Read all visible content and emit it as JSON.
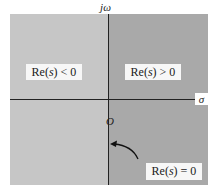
{
  "diagram": {
    "axes": {
      "vertical_label": "jω",
      "horizontal_label": "σ",
      "origin_label": "O"
    },
    "regions": {
      "left_half": {
        "label_pre": "Re(",
        "label_var": "s",
        "label_post": ") < 0",
        "color": "#c6c6c6"
      },
      "right_half": {
        "label_pre": "Re(",
        "label_var": "s",
        "label_post": ") > 0",
        "color": "#a9a9a9"
      }
    },
    "annotation": {
      "label_pre": "Re(",
      "label_var": "s",
      "label_post": ") = 0",
      "points_to": "imaginary axis"
    }
  }
}
